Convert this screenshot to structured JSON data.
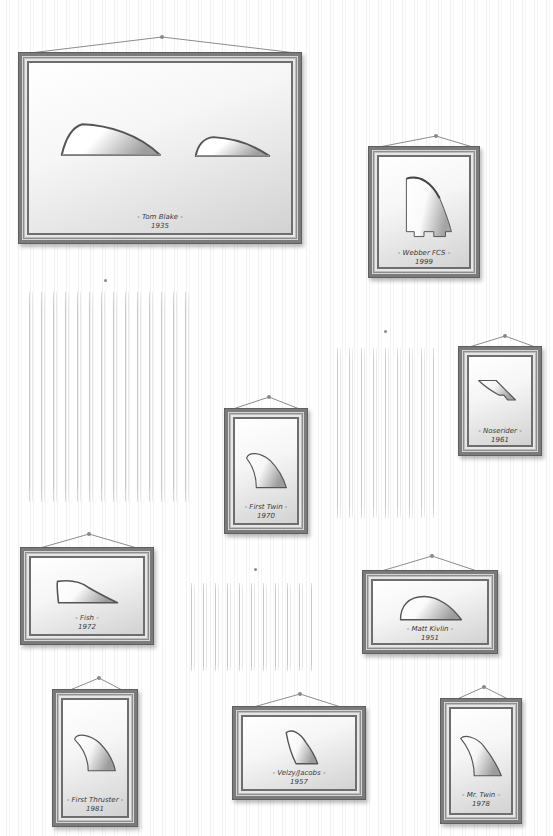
{
  "gallery": {
    "background": "#ffffff",
    "frame_color": "#7b7b7b",
    "frames": [
      {
        "id": "tom-blake",
        "name": "Tom Blake",
        "year": "1935",
        "label": "- Tom Blake -"
      },
      {
        "id": "webber-fcs",
        "name": "Webber FCS",
        "year": "1999",
        "label": "- Webber FCS -"
      },
      {
        "id": "noserider",
        "name": "Noserider",
        "year": "1961",
        "label": "- Noserider -"
      },
      {
        "id": "first-twin",
        "name": "First Twin",
        "year": "1970",
        "label": "- First Twin -"
      },
      {
        "id": "fish",
        "name": "Fish",
        "year": "1972",
        "label": "- Fish -"
      },
      {
        "id": "matt-kivlin",
        "name": "Matt Kivlin",
        "year": "1951",
        "label": "- Matt Kivlin -"
      },
      {
        "id": "first-thruster",
        "name": "First Thruster",
        "year": "1981",
        "label": "- First Thruster -"
      },
      {
        "id": "velzy-jacobs",
        "name": "Velzy/Jacobs",
        "year": "1957",
        "label": "- Velzy/Jacobs -"
      },
      {
        "id": "mr-twin",
        "name": "Mr. Twin",
        "year": "1978",
        "label": "- Mr. Twin -"
      }
    ],
    "empty_slots": 3
  }
}
